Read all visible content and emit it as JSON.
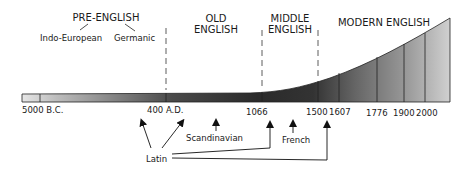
{
  "eras": [
    {
      "line1": "PRE-ENGLISH",
      "line2": ""
    },
    {
      "line1": "OLD",
      "line2": "ENGLISH"
    },
    {
      "line1": "MIDDLE",
      "line2": "ENGLISH"
    },
    {
      "line1": "MODERN ENGLISH",
      "line2": ""
    }
  ],
  "pre_english_branches": [
    "Indo-European",
    "Germanic"
  ],
  "timeline_labels": [
    "5000 B.C.",
    "400 A.D.",
    "1066",
    "1500",
    "1607",
    "1776",
    "1900",
    "2000"
  ],
  "influences": {
    "latin": "Latin",
    "scandinavian": "Scandinavian",
    "french": "French"
  },
  "colors": {
    "bar_dark": "#2e2e2e",
    "bar_light": "#d8d8d8",
    "modern_light": "#cfcfcf",
    "line": "#222222"
  }
}
